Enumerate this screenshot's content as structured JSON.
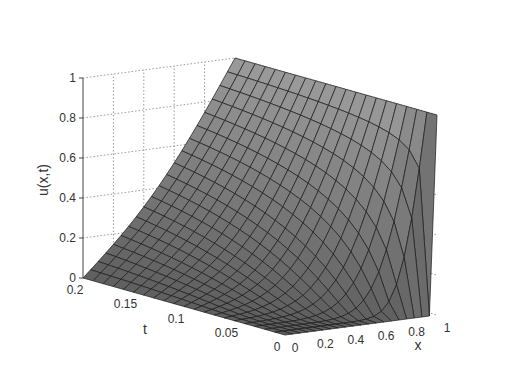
{
  "chart_data": {
    "type": "surface",
    "title": "",
    "xlabel": "x",
    "ylabel": "t",
    "zlabel": "u(x,t)",
    "x_ticks": [
      "0",
      "0.2",
      "0.4",
      "0.6",
      "0.8",
      "1"
    ],
    "t_ticks": [
      "0",
      "0.05",
      "0.1",
      "0.15",
      "0.2"
    ],
    "z_ticks": [
      "0",
      "0.2",
      "0.4",
      "0.6",
      "0.8",
      "1"
    ],
    "xlim": [
      0,
      1
    ],
    "tlim": [
      0,
      0.2
    ],
    "zlim": [
      0,
      1
    ],
    "grid": true,
    "mesh": {
      "nx": 21,
      "nt": 21
    },
    "sample_values": {
      "t=0.2": {
        "x": [
          0,
          0.2,
          0.4,
          0.6,
          0.8,
          1
        ],
        "u": [
          0,
          0.11,
          0.23,
          0.38,
          0.62,
          1
        ]
      },
      "t=0.1": {
        "x": [
          0,
          0.2,
          0.4,
          0.6,
          0.8,
          1
        ],
        "u": [
          0,
          0.03,
          0.08,
          0.19,
          0.44,
          1
        ]
      },
      "t=0": {
        "x": [
          0,
          0.2,
          0.4,
          0.6,
          0.8,
          1
        ],
        "u": [
          0,
          0,
          0,
          0,
          0,
          1
        ]
      }
    }
  },
  "colors": {
    "surface_face": "#8c8c8c",
    "surface_edge": "#1a1a1a",
    "grid": "#9a9a9a",
    "axis": "#444444",
    "text": "#333333"
  }
}
